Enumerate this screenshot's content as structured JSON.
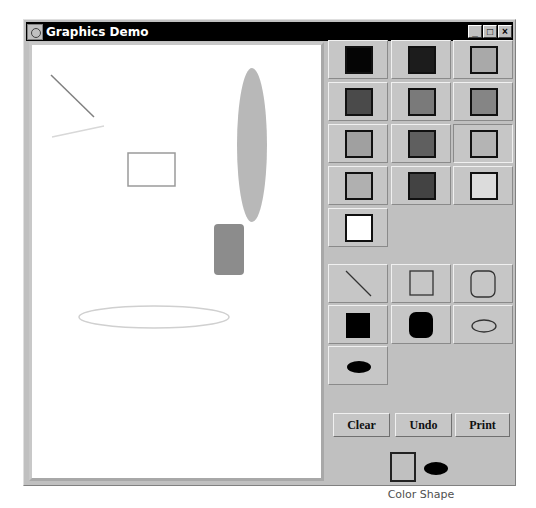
{
  "window": {
    "title": "Graphics Demo",
    "controls": {
      "minimize": "_",
      "maximize": "□",
      "close": "×"
    }
  },
  "canvas": {
    "background": "#ffffff",
    "shapes": [
      {
        "type": "line",
        "x1": 19,
        "y1": 30,
        "x2": 62,
        "y2": 72,
        "stroke": "#808080"
      },
      {
        "type": "line",
        "x1": 20,
        "y1": 92,
        "x2": 72,
        "y2": 81,
        "stroke": "#d8d8d8"
      },
      {
        "type": "rect",
        "x": 96,
        "y": 108,
        "w": 47,
        "h": 33,
        "stroke": "#9a9a9a",
        "fill": "none"
      },
      {
        "type": "ellipse",
        "cx": 220,
        "cy": 100,
        "rx": 15,
        "ry": 77,
        "fill": "#b8b8b8"
      },
      {
        "type": "roundrect",
        "x": 182,
        "y": 179,
        "w": 30,
        "h": 51,
        "rx": 4,
        "fill": "#8c8c8c"
      },
      {
        "type": "ellipse",
        "cx": 122,
        "cy": 272,
        "rx": 75,
        "ry": 11,
        "stroke": "#d0d0d0",
        "fill": "none"
      }
    ]
  },
  "palette": {
    "colors": [
      {
        "name": "black",
        "hex": "#050505"
      },
      {
        "name": "dark-gray-1",
        "hex": "#1c1c1c"
      },
      {
        "name": "silver",
        "hex": "#a9a9a9"
      },
      {
        "name": "dim-gray",
        "hex": "#4a4a4a"
      },
      {
        "name": "gray",
        "hex": "#7a7a7a"
      },
      {
        "name": "medium-gray",
        "hex": "#858585"
      },
      {
        "name": "light-gray-1",
        "hex": "#a0a0a0"
      },
      {
        "name": "gray-2",
        "hex": "#5f5f5f"
      },
      {
        "name": "light-gray-2",
        "hex": "#b4b4b4"
      },
      {
        "name": "light-gray-3",
        "hex": "#b0b0b0"
      },
      {
        "name": "dark-gray-2",
        "hex": "#434343"
      },
      {
        "name": "very-light-gray",
        "hex": "#dcdcdc"
      },
      {
        "name": "white",
        "hex": "#ffffff"
      }
    ],
    "selected_index": 8
  },
  "shapes_tools": [
    {
      "name": "line"
    },
    {
      "name": "rectangle"
    },
    {
      "name": "rounded-rectangle"
    },
    {
      "name": "filled-rectangle"
    },
    {
      "name": "filled-rounded-rectangle"
    },
    {
      "name": "oval"
    },
    {
      "name": "filled-oval"
    }
  ],
  "actions": {
    "clear": "Clear",
    "undo": "Undo",
    "print": "Print"
  },
  "current": {
    "label": "Color Shape",
    "color": "#c0c0c0",
    "shape": "filled-oval"
  }
}
